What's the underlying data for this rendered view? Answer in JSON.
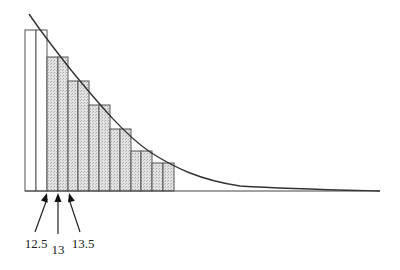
{
  "diagram": {
    "type": "histogram-with-curve",
    "colors": {
      "bar_stroke": "#555555",
      "shaded_fill": "#d9d9d9",
      "unshaded_fill": "#ffffff",
      "curve": "#333333",
      "axis": "#444444"
    },
    "baseline": {
      "x1": 25,
      "x2": 380,
      "y": 191
    },
    "bars": [
      {
        "x": 25,
        "w": 11,
        "top": 30,
        "shaded": false
      },
      {
        "x": 36,
        "w": 11,
        "top": 30,
        "shaded": false
      },
      {
        "x": 47,
        "w": 11,
        "top": 57,
        "shaded": true
      },
      {
        "x": 58,
        "w": 10,
        "top": 57,
        "shaded": true
      },
      {
        "x": 68,
        "w": 10,
        "top": 81,
        "shaded": true
      },
      {
        "x": 78,
        "w": 11,
        "top": 81,
        "shaded": true
      },
      {
        "x": 89,
        "w": 10,
        "top": 105,
        "shaded": true
      },
      {
        "x": 99,
        "w": 11,
        "top": 105,
        "shaded": true
      },
      {
        "x": 110,
        "w": 10,
        "top": 129,
        "shaded": true
      },
      {
        "x": 120,
        "w": 11,
        "top": 129,
        "shaded": true
      },
      {
        "x": 131,
        "w": 10,
        "top": 151,
        "shaded": true
      },
      {
        "x": 141,
        "w": 11,
        "top": 151,
        "shaded": true
      },
      {
        "x": 152,
        "w": 11,
        "top": 163,
        "shaded": true
      },
      {
        "x": 163,
        "w": 11,
        "top": 163,
        "shaded": true
      }
    ],
    "curve_path": "M 29 14 C 40 30, 55 50, 75 75 C 100 105, 125 135, 150 152 C 175 168, 200 180, 240 186 C 290 189, 340 190, 380 191",
    "arrows": [
      {
        "x1": 35,
        "y1": 232,
        "x2": 47,
        "y2": 193
      },
      {
        "x1": 58,
        "y1": 234,
        "x2": 58,
        "y2": 193
      },
      {
        "x1": 80,
        "y1": 232,
        "x2": 69,
        "y2": 193
      }
    ],
    "labels": [
      {
        "text": "12.5",
        "x": 36,
        "y": 236
      },
      {
        "text": "13",
        "x": 58,
        "y": 242
      },
      {
        "text": "13.5",
        "x": 83,
        "y": 236
      }
    ]
  }
}
